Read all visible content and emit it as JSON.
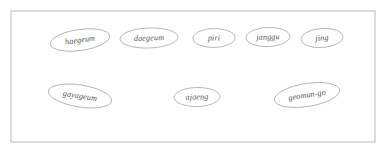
{
  "diagram": {
    "type": "node-graph",
    "canvas": {
      "width": 387,
      "height": 149
    },
    "frame": {
      "name": "diagram-border",
      "x": 11,
      "y": 11,
      "width": 364,
      "height": 131,
      "stroke_color": "#b9b9b9",
      "fill_color": "#ffffff"
    },
    "style": {
      "node_stroke_color": "#a8a8a8",
      "node_fill_color": "#ffffff",
      "label_color": "#555555",
      "background_color": "#ffffff"
    },
    "nodes": [
      {
        "id": "haegeum",
        "label": "haegeum",
        "cx": 80,
        "cy": 40,
        "rx": 30,
        "ry": 10.5,
        "rotation": -8
      },
      {
        "id": "daegeum",
        "label": "daegeum",
        "cx": 149,
        "cy": 38,
        "rx": 29,
        "ry": 10,
        "rotation": -2
      },
      {
        "id": "piri",
        "label": "piri",
        "cx": 214,
        "cy": 38,
        "rx": 21,
        "ry": 9.5,
        "rotation": -1
      },
      {
        "id": "janggu",
        "label": "janggu",
        "cx": 268,
        "cy": 37,
        "rx": 22,
        "ry": 9.5,
        "rotation": -2
      },
      {
        "id": "jing",
        "label": "jing",
        "cx": 322,
        "cy": 38,
        "rx": 21,
        "ry": 9.5,
        "rotation": -4
      },
      {
        "id": "gayageum",
        "label": "gayageum",
        "cx": 80,
        "cy": 96,
        "rx": 32,
        "ry": 11,
        "rotation": 9
      },
      {
        "id": "ajaeng",
        "label": "ajaeng",
        "cx": 197,
        "cy": 97,
        "rx": 23,
        "ry": 9.5,
        "rotation": -1
      },
      {
        "id": "geomun-go",
        "label": "geomun-go",
        "cx": 307,
        "cy": 95,
        "rx": 33,
        "ry": 11.5,
        "rotation": -9
      }
    ],
    "edges": []
  }
}
